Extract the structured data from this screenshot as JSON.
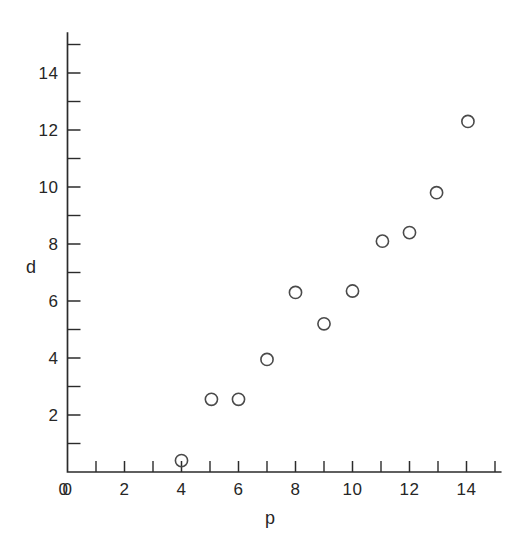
{
  "chart_data": {
    "type": "scatter",
    "title": "",
    "xlabel": "p",
    "ylabel": "d",
    "xlim": [
      0,
      15.2
    ],
    "ylim": [
      0,
      15.4
    ],
    "grid": false,
    "legend": null,
    "x_major_ticks": [
      0,
      2,
      4,
      6,
      8,
      10,
      12,
      14
    ],
    "x_major_tick_labels": [
      "0",
      "2",
      "4",
      "6",
      "8",
      "10",
      "12",
      "14"
    ],
    "x_minor_ticks": [
      1,
      3,
      5,
      7,
      9,
      11,
      13,
      15
    ],
    "y_major_ticks": [
      0,
      2,
      4,
      6,
      8,
      10,
      12,
      14
    ],
    "y_major_tick_labels": [
      "0",
      "2",
      "4",
      "6",
      "8",
      "10",
      "12",
      "14"
    ],
    "y_minor_ticks": [
      1,
      3,
      5,
      7,
      9,
      11,
      13,
      15
    ],
    "marker": "open-circle",
    "marker_color": "#4a4a4a",
    "points": [
      {
        "x": 4.0,
        "y": 0.4
      },
      {
        "x": 5.05,
        "y": 2.55
      },
      {
        "x": 6.0,
        "y": 2.55
      },
      {
        "x": 7.0,
        "y": 3.95
      },
      {
        "x": 8.0,
        "y": 6.3
      },
      {
        "x": 9.0,
        "y": 5.2
      },
      {
        "x": 10.0,
        "y": 6.35
      },
      {
        "x": 11.05,
        "y": 8.1
      },
      {
        "x": 12.0,
        "y": 8.4
      },
      {
        "x": 12.95,
        "y": 9.8
      },
      {
        "x": 14.05,
        "y": 12.3
      }
    ]
  }
}
